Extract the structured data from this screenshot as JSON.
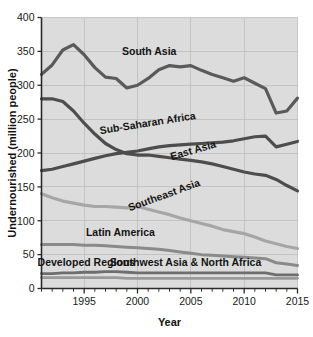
{
  "chart_data": {
    "type": "line",
    "title": "",
    "xlabel": "Year",
    "ylabel": "Undernourished (million people)",
    "xlim": [
      1991,
      2015
    ],
    "ylim": [
      0,
      400
    ],
    "xticks": [
      1995,
      2000,
      2005,
      2010,
      2015
    ],
    "xtick_labels": [
      "1995",
      "2000",
      "2005",
      "2010",
      "2015"
    ],
    "yticks": [
      0,
      50,
      100,
      150,
      200,
      250,
      300,
      350,
      400
    ],
    "ytick_labels": [
      "0",
      "50",
      "100",
      "150",
      "200",
      "250",
      "300",
      "350",
      "400"
    ],
    "minor_xticks_every": 1,
    "grid": true,
    "grid_color": "#bdbdbd",
    "plot_background": "#dcdcdc",
    "legend": "inline-labels",
    "x": [
      1991,
      1992,
      1993,
      1994,
      1995,
      1996,
      1997,
      1998,
      1999,
      2000,
      2001,
      2002,
      2003,
      2004,
      2005,
      2006,
      2007,
      2008,
      2009,
      2010,
      2011,
      2012,
      2013,
      2014,
      2015
    ],
    "series": [
      {
        "name": "South Asia",
        "color": "#5a5a5a",
        "width": 3.2,
        "label_x": 2001.1,
        "label_y": 345,
        "label_rotation": 0,
        "values": [
          316,
          330,
          352,
          360,
          345,
          326,
          312,
          310,
          296,
          300,
          310,
          323,
          329,
          327,
          329,
          322,
          316,
          311,
          306,
          311,
          303,
          295,
          259,
          262,
          281
        ]
      },
      {
        "name": "Sub-Saharan Africa",
        "color": "#4d4d4d",
        "width": 3.2,
        "label_x": 2001.0,
        "label_y": 239,
        "label_rotation": -9,
        "values": [
          174,
          176,
          180,
          184,
          188,
          192,
          196,
          199,
          201,
          203,
          206,
          209,
          211,
          212,
          213,
          214,
          215,
          216,
          218,
          221,
          224,
          225,
          209,
          213,
          217
        ]
      },
      {
        "name": "East Asia",
        "color": "#4d4d4d",
        "width": 3.2,
        "label_x": 2005.3,
        "label_y": 199,
        "label_rotation": -16,
        "values": [
          280,
          280,
          276,
          262,
          244,
          228,
          214,
          205,
          199,
          197,
          197,
          195,
          193,
          191,
          189,
          187,
          184,
          180,
          176,
          172,
          169,
          167,
          161,
          152,
          144
        ]
      },
      {
        "name": "Southeast Asia",
        "color": "#a6a6a6",
        "width": 3.2,
        "label_x": 2002.6,
        "label_y": 133,
        "label_rotation": -20,
        "values": [
          140,
          134,
          129,
          126,
          123,
          121,
          121,
          120,
          119,
          121,
          117,
          113,
          109,
          104,
          100,
          96,
          92,
          87,
          84,
          81,
          76,
          70,
          66,
          62,
          59
        ]
      },
      {
        "name": "Latin America",
        "color": "#8a8a8a",
        "width": 3.0,
        "label_x": 1998.4,
        "label_y": 78,
        "label_rotation": 0,
        "values": [
          65,
          65,
          65,
          65,
          64,
          64,
          63,
          62,
          61,
          60,
          59,
          58,
          56,
          54,
          52,
          50,
          49,
          48,
          47,
          46,
          45,
          44,
          38,
          36,
          34
        ]
      },
      {
        "name": "Southwest Asia & North Africa",
        "color": "#6e6e6e",
        "width": 2.8,
        "label_x": 2004.5,
        "label_y": 33,
        "label_rotation": 0,
        "values": [
          22,
          22,
          23,
          23,
          24,
          24,
          25,
          25,
          24,
          23,
          23,
          23,
          23,
          23,
          23,
          23,
          23,
          23,
          23,
          23,
          23,
          23,
          20,
          20,
          20
        ]
      },
      {
        "name": "Developed Regions",
        "color": "#9a9a9a",
        "width": 2.8,
        "label_x": 1995.2,
        "label_y": 33,
        "label_rotation": 0,
        "values": [
          16,
          16,
          16,
          16,
          16,
          16,
          16,
          16,
          15,
          15,
          15,
          15,
          15,
          15,
          15,
          15,
          15,
          15,
          15,
          15,
          15,
          15,
          15,
          15,
          15
        ]
      }
    ]
  }
}
